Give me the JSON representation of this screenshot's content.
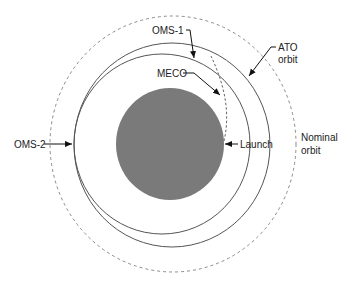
{
  "diagram": {
    "labels": {
      "oms1": "OMS-1",
      "meco": "MECO",
      "ato_line1": "ATO",
      "ato_line2": "orbit",
      "nominal_line1": "Nominal",
      "nominal_line2": "orbit",
      "launch": "Launch",
      "oms2": "OMS-2"
    },
    "colors": {
      "earth": "#7a7a7a",
      "orbit_line": "#555555",
      "dashed_line": "#888888",
      "arrow": "#111111",
      "text": "#222222"
    },
    "elements": [
      {
        "id": "earth",
        "shape": "filled-circle"
      },
      {
        "id": "nominal-orbit",
        "shape": "dashed-circle",
        "label": "Nominal orbit"
      },
      {
        "id": "ato-orbit",
        "shape": "solid-circle",
        "label": "ATO orbit"
      },
      {
        "id": "transfer-orbit",
        "shape": "solid-ellipse"
      },
      {
        "id": "ascent-trajectory",
        "shape": "dashed-arc",
        "from": "Launch",
        "to": "MECO"
      }
    ]
  }
}
